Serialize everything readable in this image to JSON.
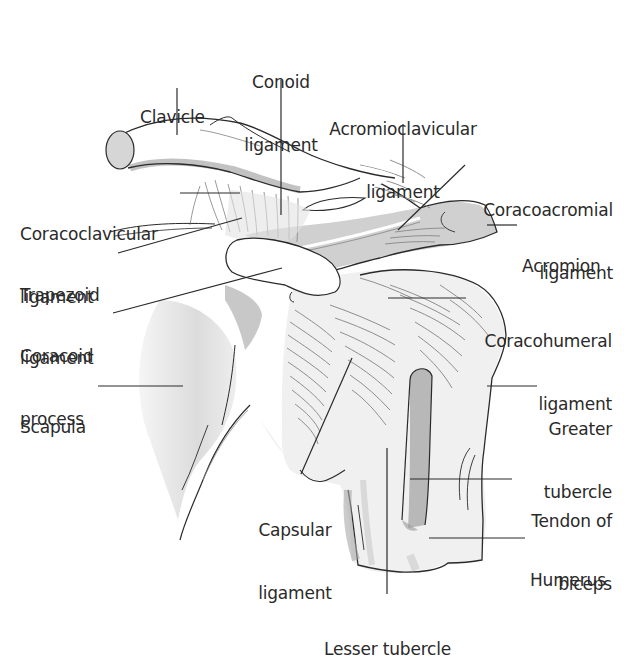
{
  "diagram": {
    "colors": {
      "background": "#ffffff",
      "outline": "#2a2a2a",
      "shade_light": "#e6e6e6",
      "shade_mid": "#cfcfcf",
      "shade_dark": "#a9a9a9",
      "fiber": "#8f8f8f",
      "text": "#2a2a2a"
    },
    "labels": {
      "clavicle": {
        "line1": "Clavicle"
      },
      "conoid": {
        "line1": "Conoid",
        "line2": "ligament"
      },
      "acromioclavicular": {
        "line1": "Acromioclavicular",
        "line2": "ligament"
      },
      "coracoacromial": {
        "line1": "Coracoacromial",
        "line2": "ligament"
      },
      "acromion": {
        "line1": "Acromion"
      },
      "coracoclavicular": {
        "line1": "Coracoclavicular",
        "line2": "ligament"
      },
      "trapezoid": {
        "line1": "Trapezoid",
        "line2": "ligament"
      },
      "coracoid": {
        "line1": "Coracoid",
        "line2": "process"
      },
      "coracohumeral": {
        "line1": "Coracohumeral",
        "line2": "ligament"
      },
      "scapula": {
        "line1": "Scapula"
      },
      "greater_tubercle": {
        "line1": "Greater",
        "line2": "tubercle"
      },
      "capsular": {
        "line1": "Capsular",
        "line2": "ligament"
      },
      "tendon_biceps": {
        "line1": "Tendon of",
        "line2": "biceps"
      },
      "humerus": {
        "line1": "Humerus"
      },
      "lesser_tubercle": {
        "line1": "Lesser tubercle"
      }
    }
  }
}
